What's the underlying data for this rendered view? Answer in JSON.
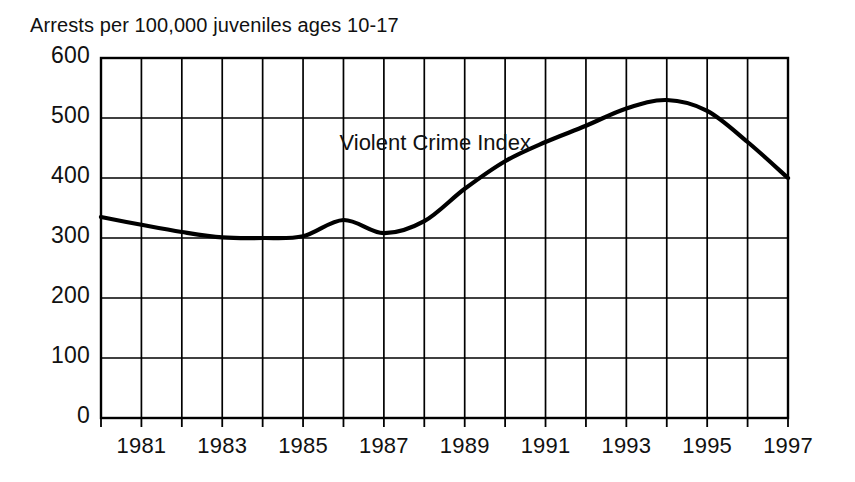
{
  "chart_data": {
    "type": "line",
    "title": "Arrests per 100,000 juveniles ages 10-17",
    "xlabel": "",
    "ylabel": "",
    "ylim": [
      0,
      600
    ],
    "xlim": [
      1980,
      1997
    ],
    "grid": true,
    "legend_position": "inline-annotation",
    "annotations": [
      {
        "text": "Violent Crime Index",
        "x": 1986.0,
        "y": 455
      }
    ],
    "ytick_labels": [
      "600",
      "500",
      "400",
      "300",
      "200",
      "100",
      "0"
    ],
    "ytick_values": [
      600,
      500,
      400,
      300,
      200,
      100,
      0
    ],
    "xtick_values": [
      1980,
      1981,
      1982,
      1983,
      1984,
      1985,
      1986,
      1987,
      1988,
      1989,
      1990,
      1991,
      1992,
      1993,
      1994,
      1995,
      1996,
      1997
    ],
    "xtick_labels": [
      "1981",
      "1983",
      "1985",
      "1987",
      "1989",
      "1991",
      "1993",
      "1995",
      "1997"
    ],
    "xtick_label_values": [
      1981,
      1983,
      1985,
      1987,
      1989,
      1991,
      1993,
      1995,
      1997
    ],
    "series": [
      {
        "name": "Violent Crime Index",
        "color": "#000000",
        "x": [
          1980,
          1981,
          1982,
          1983,
          1984,
          1985,
          1986,
          1987,
          1988,
          1989,
          1990,
          1991,
          1992,
          1993,
          1994,
          1995,
          1996,
          1997
        ],
        "values": [
          335,
          322,
          310,
          301,
          300,
          303,
          330,
          308,
          328,
          382,
          428,
          460,
          487,
          516,
          530,
          512,
          460,
          400
        ]
      }
    ]
  },
  "colors": {
    "line": "#000000",
    "grid": "#000000",
    "axis": "#000000",
    "background": "#ffffff",
    "text": "#111111"
  }
}
